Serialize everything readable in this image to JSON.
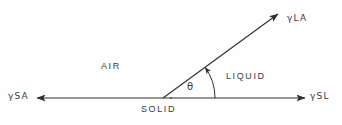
{
  "diagram": {
    "background_color": "#fefefe",
    "line_color": "#2e2e2e",
    "text_color": "#3a3a3a",
    "labels": {
      "gamma_la": "γLA",
      "gamma_sa": "γSA",
      "gamma_sl": "γSL",
      "theta": "θ",
      "air": "AIR",
      "liquid": "LIQUID",
      "solid": "SOLID"
    },
    "geometry": {
      "vertex_x": 163,
      "vertex_y": 98,
      "baseline_y": 98,
      "baseline_left_x": 37,
      "baseline_right_x": 305,
      "slant_tip_x": 278,
      "slant_tip_y": 14,
      "contact_angle_degrees": 36,
      "arc_radius": 52
    }
  }
}
